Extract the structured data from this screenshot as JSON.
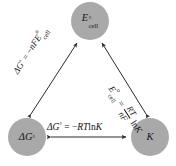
{
  "diagram": {
    "background_color": "#ffffff",
    "node_fill_color": "#a9a9a9",
    "line_color": "#333333",
    "text_color": "#111111",
    "nodes": [
      {
        "id": "ecell",
        "label_main": "E",
        "label_degree": "°",
        "label_sub": "cell",
        "position": "top"
      },
      {
        "id": "deltag",
        "label_main": "ΔG",
        "label_degree": "°",
        "label_sub": "",
        "position": "bottom-left"
      },
      {
        "id": "k",
        "label_main": "K",
        "label_degree": "",
        "label_sub": "",
        "position": "bottom-right"
      }
    ],
    "edges": [
      {
        "id": "bottom",
        "from": "deltag",
        "to": "k",
        "arrow": "double",
        "equation_text": "ΔG° = −RT ln K",
        "lhs": "ΔG",
        "lhs_degree": "°",
        "equals": "=",
        "rhs_sign": "−",
        "rhs_rt": "RT",
        "rhs_ln": "ln",
        "rhs_k": "K"
      },
      {
        "id": "left",
        "from": "deltag",
        "to": "ecell",
        "arrow": "double",
        "equation_text": "ΔG° = −nFE°cell",
        "lhs": "ΔG",
        "lhs_degree": "°",
        "equals": "=",
        "rhs_sign": "−",
        "rhs_nf": "nF",
        "rhs_e": "E",
        "rhs_degree": "°",
        "rhs_sub": "cell"
      },
      {
        "id": "right",
        "from": "k",
        "to": "ecell",
        "arrow": "double",
        "equation_text": "E°cell = (RT / nF) ln K",
        "lhs_e": "E",
        "lhs_degree": "°",
        "lhs_sub": "cell",
        "equals": "=",
        "frac_numerator": "RT",
        "frac_denominator": "nF",
        "rhs_ln": "ln",
        "rhs_k": "K"
      }
    ]
  }
}
